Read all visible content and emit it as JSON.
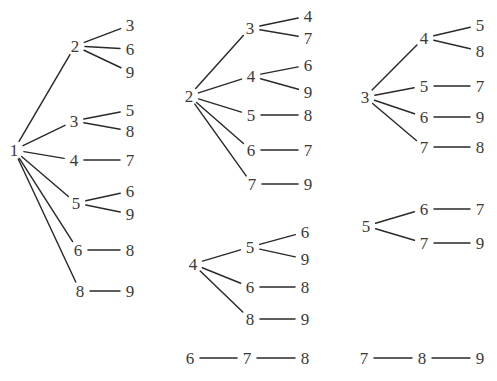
{
  "figure": {
    "title": "",
    "background_color": "#ffffff",
    "edge_color": "#2a2a2a",
    "label_color": "#3a3a3a",
    "width": 497,
    "height": 381
  },
  "chart_data": {
    "type": "diagram",
    "diagram_kind": "forest-of-trees",
    "title": "",
    "xlabel": "",
    "ylabel": "",
    "grid": false,
    "legend": null,
    "trees": [
      {
        "id": "tree-1",
        "column": 1,
        "root": "1",
        "root_pos": [
          14,
          150
        ],
        "branches": [
          {
            "node": "2",
            "pos": [
              75,
              46
            ],
            "leaves": [
              {
                "label": "3",
                "pos": [
                  130,
                  25
                ]
              },
              {
                "label": "6",
                "pos": [
                  130,
                  49
                ]
              },
              {
                "label": "9",
                "pos": [
                  130,
                  72
                ]
              }
            ]
          },
          {
            "node": "3",
            "pos": [
              74,
              121
            ],
            "leaves": [
              {
                "label": "5",
                "pos": [
                  130,
                  110
                ]
              },
              {
                "label": "8",
                "pos": [
                  130,
                  131
                ]
              }
            ]
          },
          {
            "node": "4",
            "pos": [
              74,
              160
            ],
            "leaves": [
              {
                "label": "7",
                "pos": [
                  130,
                  160
                ]
              }
            ]
          },
          {
            "node": "5",
            "pos": [
              76,
              203
            ],
            "leaves": [
              {
                "label": "6",
                "pos": [
                  130,
                  191
                ]
              },
              {
                "label": "9",
                "pos": [
                  130,
                  214
                ]
              }
            ]
          },
          {
            "node": "6",
            "pos": [
              78,
              250
            ],
            "leaves": [
              {
                "label": "8",
                "pos": [
                  130,
                  250
                ]
              }
            ]
          },
          {
            "node": "8",
            "pos": [
              80,
              291
            ],
            "leaves": [
              {
                "label": "9",
                "pos": [
                  130,
                  291
                ]
              }
            ]
          }
        ]
      },
      {
        "id": "tree-2",
        "column": 2,
        "root": "2",
        "root_pos": [
          189,
          96
        ],
        "branches": [
          {
            "node": "3",
            "pos": [
              250,
              28
            ],
            "leaves": [
              {
                "label": "4",
                "pos": [
                  308,
                  16
                ]
              },
              {
                "label": "7",
                "pos": [
                  308,
                  38
                ]
              }
            ]
          },
          {
            "node": "4",
            "pos": [
              251,
              76
            ],
            "leaves": [
              {
                "label": "6",
                "pos": [
                  308,
                  65
                ]
              },
              {
                "label": "9",
                "pos": [
                  308,
                  92
                ]
              }
            ]
          },
          {
            "node": "5",
            "pos": [
              251,
              115
            ],
            "leaves": [
              {
                "label": "8",
                "pos": [
                  308,
                  115
                ]
              }
            ]
          },
          {
            "node": "6",
            "pos": [
              251,
              150
            ],
            "leaves": [
              {
                "label": "7",
                "pos": [
                  308,
                  150
                ]
              }
            ]
          },
          {
            "node": "7",
            "pos": [
              252,
              184
            ],
            "leaves": [
              {
                "label": "9",
                "pos": [
                  308,
                  184
                ]
              }
            ]
          }
        ]
      },
      {
        "id": "tree-3",
        "column": 3,
        "root": "3",
        "root_pos": [
          365,
          97
        ],
        "branches": [
          {
            "node": "4",
            "pos": [
              424,
              38
            ],
            "leaves": [
              {
                "label": "5",
                "pos": [
                  480,
                  25
                ]
              },
              {
                "label": "8",
                "pos": [
                  480,
                  51
                ]
              }
            ]
          },
          {
            "node": "5",
            "pos": [
              424,
              86
            ],
            "leaves": [
              {
                "label": "7",
                "pos": [
                  480,
                  86
                ]
              }
            ]
          },
          {
            "node": "6",
            "pos": [
              424,
              117
            ],
            "leaves": [
              {
                "label": "9",
                "pos": [
                  480,
                  117
                ]
              }
            ]
          },
          {
            "node": "7",
            "pos": [
              424,
              147
            ],
            "leaves": [
              {
                "label": "8",
                "pos": [
                  480,
                  147
                ]
              }
            ]
          }
        ]
      },
      {
        "id": "tree-4",
        "column": 2,
        "root": "4",
        "root_pos": [
          193,
          264
        ],
        "branches": [
          {
            "node": "5",
            "pos": [
              250,
              247
            ],
            "leaves": [
              {
                "label": "6",
                "pos": [
                  305,
                  232
                ]
              },
              {
                "label": "9",
                "pos": [
                  305,
                  259
                ]
              }
            ]
          },
          {
            "node": "6",
            "pos": [
              250,
              287
            ],
            "leaves": [
              {
                "label": "8",
                "pos": [
                  305,
                  287
                ]
              }
            ]
          },
          {
            "node": "8",
            "pos": [
              250,
              319
            ],
            "leaves": [
              {
                "label": "9",
                "pos": [
                  305,
                  319
                ]
              }
            ]
          }
        ]
      },
      {
        "id": "tree-5",
        "column": 3,
        "root": "5",
        "root_pos": [
          366,
          226
        ],
        "branches": [
          {
            "node": "6",
            "pos": [
              424,
              209
            ],
            "leaves": [
              {
                "label": "7",
                "pos": [
                  480,
                  209
                ]
              }
            ]
          },
          {
            "node": "7",
            "pos": [
              424,
              243
            ],
            "leaves": [
              {
                "label": "9",
                "pos": [
                  480,
                  243
                ]
              }
            ]
          }
        ]
      },
      {
        "id": "tree-6",
        "column": 2,
        "root": "6",
        "root_pos": [
          190,
          358
        ],
        "branches": [
          {
            "node": "7",
            "pos": [
              247,
              358
            ],
            "leaves": [
              {
                "label": "8",
                "pos": [
                  305,
                  358
                ]
              }
            ]
          }
        ]
      },
      {
        "id": "tree-7",
        "column": 3,
        "root": "7",
        "root_pos": [
          364,
          358
        ],
        "branches": [
          {
            "node": "8",
            "pos": [
              422,
              358
            ],
            "leaves": [
              {
                "label": "9",
                "pos": [
                  480,
                  358
                ]
              }
            ]
          }
        ]
      }
    ]
  }
}
